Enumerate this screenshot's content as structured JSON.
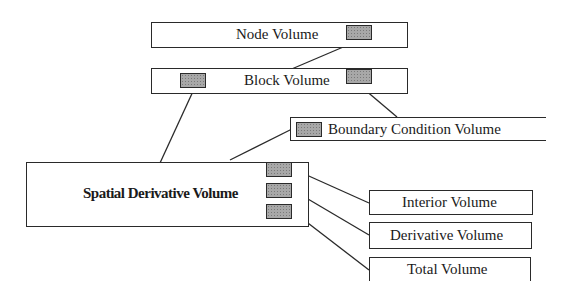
{
  "diagram": {
    "nodes": {
      "node_volume": {
        "label": "Node Volume"
      },
      "block_volume": {
        "label": "Block Volume"
      },
      "boundary_condition_volume": {
        "label": "Boundary Condition Volume"
      },
      "spatial_derivative_volume": {
        "label": "Spatial Derivative Volume"
      },
      "interior_volume": {
        "label": "Interior Volume"
      },
      "derivative_volume": {
        "label": "Derivative Volume"
      },
      "total_volume": {
        "label": "Total Volume"
      }
    },
    "edges": [
      {
        "from": "node_volume",
        "to": "block_volume"
      },
      {
        "from": "block_volume",
        "to": "spatial_derivative_volume"
      },
      {
        "from": "block_volume",
        "to": "boundary_condition_volume"
      },
      {
        "from": "boundary_condition_volume",
        "to": "spatial_derivative_volume"
      },
      {
        "from": "spatial_derivative_volume",
        "to": "interior_volume"
      },
      {
        "from": "spatial_derivative_volume",
        "to": "derivative_volume"
      },
      {
        "from": "spatial_derivative_volume",
        "to": "total_volume"
      }
    ],
    "pointer_fill_color": "#a8a8a8",
    "line_color": "#2a2a2a"
  }
}
